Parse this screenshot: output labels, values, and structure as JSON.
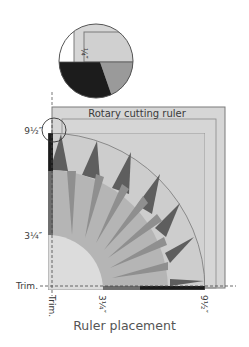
{
  "figure": {
    "caption": "Ruler placement",
    "ruler_label": "Rotary cutting ruler",
    "detail_inset": {
      "label": "¼″"
    },
    "left_labels": {
      "top": "9½″",
      "middle": "3¼″",
      "trim": "Trim."
    },
    "bottom_labels": {
      "trim": "Trim.",
      "middle": "3¼″",
      "right": "9½″"
    },
    "colors": {
      "ruler_fill": "#d4d4d4",
      "ruler_stroke": "#7a7a7a",
      "background_light": "#cfcfcf",
      "ring_mid": "#b3b3b3",
      "spike_dark": "#5e5e5e",
      "ray_gray": "#8f8f8f",
      "center_light": "#dcdcdc",
      "black_strip": "#1c1c1c"
    }
  }
}
